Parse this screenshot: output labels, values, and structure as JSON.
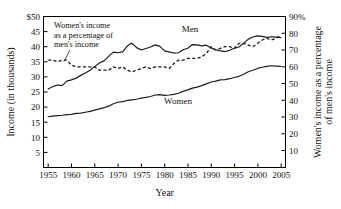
{
  "chart_data": {
    "type": "line",
    "title": "",
    "xlabel": "Year",
    "ylabel": "Income (in thousands)",
    "ylabel_right": "Women's income as a percentage of men's income",
    "ylabel_right_line1": "Women's income as a percentage",
    "ylabel_right_line2": "of men's income",
    "xlim": [
      1954,
      2006
    ],
    "ylim": [
      0,
      50
    ],
    "ylim_right": [
      0,
      90
    ],
    "grid": false,
    "legend": "inline-labels",
    "xticks": [
      "1955",
      "1960",
      "1965",
      "1970",
      "1975",
      "1980",
      "1985",
      "1990",
      "1995",
      "2000",
      "2005"
    ],
    "xtick_values": [
      1955,
      1960,
      1965,
      1970,
      1975,
      1980,
      1985,
      1990,
      1995,
      2000,
      2005
    ],
    "yticks_left": [
      "$50",
      "45",
      "40",
      "35",
      "30",
      "25",
      "20",
      "15",
      "10",
      "5"
    ],
    "ytick_values_left": [
      50,
      45,
      40,
      35,
      30,
      25,
      20,
      15,
      10,
      5
    ],
    "yticks_right": [
      "90%",
      "80",
      "70",
      "60",
      "50",
      "40",
      "30",
      "20",
      "10"
    ],
    "ytick_values_right": [
      90,
      80,
      70,
      60,
      50,
      40,
      30,
      20,
      10
    ],
    "annotations": [
      {
        "name": "ratio-callout",
        "line1": "Women's income",
        "line2": "as a percentage of",
        "line3": "men's income",
        "points_to_series": "ratio"
      }
    ],
    "x": [
      1955,
      1956,
      1957,
      1958,
      1959,
      1960,
      1961,
      1962,
      1963,
      1964,
      1965,
      1966,
      1967,
      1968,
      1969,
      1970,
      1971,
      1972,
      1973,
      1974,
      1975,
      1976,
      1977,
      1978,
      1979,
      1980,
      1981,
      1982,
      1983,
      1984,
      1985,
      1986,
      1987,
      1988,
      1989,
      1990,
      1991,
      1992,
      1993,
      1994,
      1995,
      1996,
      1997,
      1998,
      1999,
      2000,
      2001,
      2002,
      2003,
      2004,
      2005
    ],
    "series": [
      {
        "name": "Men",
        "label": "Men",
        "axis": "left",
        "style": "solid",
        "units": "thousands of dollars",
        "values": [
          26.0,
          26.8,
          27.3,
          27.1,
          28.6,
          29.0,
          29.6,
          30.5,
          31.3,
          32.2,
          33.4,
          34.6,
          35.3,
          36.8,
          38.2,
          38.0,
          38.3,
          40.2,
          41.2,
          39.7,
          38.9,
          39.4,
          39.9,
          40.6,
          40.1,
          38.6,
          38.3,
          37.9,
          38.0,
          39.0,
          39.5,
          40.7,
          40.6,
          40.3,
          40.5,
          39.6,
          39.0,
          38.6,
          38.4,
          38.8,
          39.5,
          39.9,
          41.1,
          42.5,
          43.2,
          43.6,
          43.4,
          43.1,
          43.3,
          43.2,
          43.0
        ]
      },
      {
        "name": "Women",
        "label": "Women",
        "axis": "left",
        "style": "solid",
        "units": "thousands of dollars",
        "values": [
          16.8,
          17.0,
          17.2,
          17.3,
          17.5,
          17.6,
          17.9,
          18.0,
          18.3,
          18.6,
          19.0,
          19.4,
          19.8,
          20.3,
          21.1,
          21.6,
          21.8,
          22.2,
          22.4,
          22.6,
          23.0,
          23.2,
          23.5,
          24.0,
          24.1,
          23.9,
          24.0,
          24.2,
          24.6,
          25.2,
          25.7,
          26.3,
          26.6,
          27.1,
          27.7,
          28.3,
          28.6,
          29.0,
          29.1,
          29.4,
          29.8,
          30.2,
          30.9,
          31.7,
          32.2,
          32.8,
          33.2,
          33.5,
          33.7,
          33.6,
          33.5
        ]
      },
      {
        "name": "Women's income as a percentage of men's income",
        "label": "ratio",
        "axis": "right",
        "style": "dashed",
        "units": "percent",
        "values": [
          64,
          64,
          63,
          64,
          64,
          61,
          60,
          60,
          60,
          60,
          60,
          58,
          58,
          58,
          60,
          59,
          60,
          58,
          57,
          58,
          59,
          60,
          59,
          60,
          60,
          60,
          59,
          62,
          64,
          64,
          65,
          65,
          65,
          66,
          68,
          72,
          70,
          71,
          72,
          72,
          71,
          74,
          74,
          73,
          72,
          74,
          76,
          77,
          76,
          77,
          79
        ]
      }
    ]
  }
}
